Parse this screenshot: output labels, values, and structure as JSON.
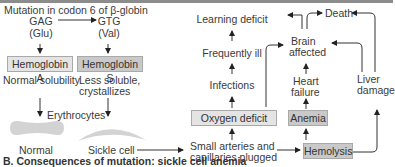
{
  "mutation": {
    "title": "Mutation in codon 6 of β-globin",
    "normal_codon": "GAG",
    "normal_aa": "(Glu)",
    "mutant_codon": "GTG",
    "mutant_aa": "(Val)"
  },
  "hemoglobin_a": {
    "label": "Hemoglobin A",
    "property": "Normal solubility"
  },
  "hemoglobin_s": {
    "label": "Hemoglobin S",
    "property_line1": "Less soluble,",
    "property_line2": "crystallizes"
  },
  "erythrocytes": {
    "label": "Erythrocytes",
    "normal": "Normal",
    "sickle": "Sickle cell"
  },
  "consequences": {
    "plugged_line1": "Small arteries and",
    "plugged_line2": "capillaries plugged",
    "oxygen_deficit": "Oxygen deficit",
    "infections": "Infections",
    "frequently_ill": "Frequently ill",
    "learning_deficit": "Learning deficit",
    "brain_line1": "Brain",
    "brain_line2": "affected",
    "death": "Death",
    "heart_line1": "Heart",
    "heart_line2": "failure",
    "anemia": "Anemia",
    "hemolysis": "Hemolysis",
    "liver_line1": "Liver",
    "liver_line2": "damage"
  },
  "caption": "B. Consequences of mutation: sickle cell anemia",
  "colors": {
    "box_light": "#e4e4e4",
    "box_dark": "#c9c9c9",
    "cell": "#d3d3d3"
  }
}
